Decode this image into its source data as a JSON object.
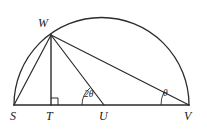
{
  "figure": {
    "type": "geometry-diagram",
    "width": 207,
    "height": 130,
    "background_color": "#ffffff",
    "stroke_color": "#2b2b2b",
    "label_color": "#1a1a1a"
  },
  "vertices": {
    "S": {
      "label": "S",
      "x": 14,
      "y": 105
    },
    "T": {
      "label": "T",
      "x": 51,
      "y": 105
    },
    "U": {
      "label": "U",
      "x": 104,
      "y": 105
    },
    "V": {
      "label": "V",
      "x": 189,
      "y": 105
    },
    "W": {
      "label": "W",
      "x": 51,
      "y": 35
    }
  },
  "semicircle": {
    "center_x": 101.5,
    "center_y": 105,
    "radius": 87.5,
    "start_x": 14,
    "start_y": 105,
    "end_x": 189,
    "end_y": 105
  },
  "segments": [
    {
      "name": "segment-SV-baseline",
      "x1": 14,
      "y1": 105,
      "x2": 189,
      "y2": 105
    },
    {
      "name": "segment-SW",
      "x1": 14,
      "y1": 105,
      "x2": 51,
      "y2": 35
    },
    {
      "name": "segment-WT",
      "x1": 51,
      "y1": 35,
      "x2": 51,
      "y2": 105
    },
    {
      "name": "segment-WU",
      "x1": 51,
      "y1": 35,
      "x2": 104,
      "y2": 105
    },
    {
      "name": "segment-WV",
      "x1": 51,
      "y1": 35,
      "x2": 189,
      "y2": 105
    }
  ],
  "angles": [
    {
      "name": "angle-two-theta-at-U",
      "label": "2θ",
      "vertex": "U",
      "value_text": "2θ"
    },
    {
      "name": "angle-theta-at-V",
      "label": "θ",
      "vertex": "V",
      "value_text": "θ"
    }
  ],
  "right_angle": {
    "name": "right-angle-mark-at-T",
    "vertex": "T",
    "size": 7,
    "description": "square mark indicating WT perpendicular to SV"
  },
  "labels": {
    "S": "S",
    "T": "T",
    "U": "U",
    "V": "V",
    "W": "W",
    "two_theta": "2θ",
    "theta": "θ"
  }
}
